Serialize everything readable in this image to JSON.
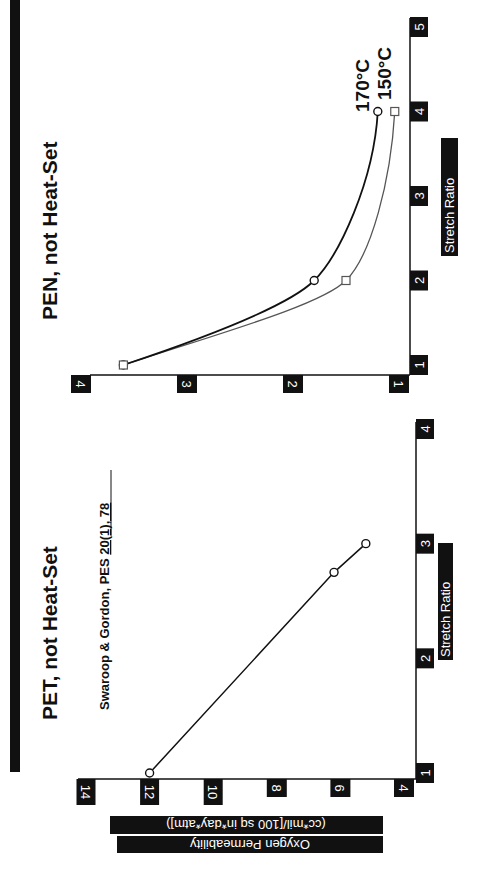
{
  "figure": {
    "orientation": "rotated 90 degrees clockwise",
    "colors": {
      "ink": "#111111",
      "label_box": "#111111",
      "label_text": "#ffffff",
      "series_150": "#555555",
      "background": "#ffffff"
    }
  },
  "y_axis_label": {
    "line1": "Oxygen Permeability",
    "line2": "(cc*mil/[100 sq in*day*atm])"
  },
  "panels": {
    "pet": {
      "title": "PET, not Heat-Set",
      "citation_prefix": "Swaroop & Gordon, PES ",
      "citation_underlined": "20(1), 78",
      "x_label": "Stretch Ratio",
      "x_ticks": [
        "1",
        "2",
        "3",
        "4"
      ],
      "y_ticks": [
        "4",
        "6",
        "8",
        "10",
        "12",
        "14"
      ]
    },
    "pen": {
      "title": "PEN, not Heat-Set",
      "x_label": "Stretch Ratio",
      "x_ticks": [
        "1",
        "2",
        "3",
        "4",
        "5"
      ],
      "y_ticks": [
        "1",
        "2",
        "3",
        "4"
      ],
      "legend": {
        "s170": "170°C",
        "s150": "150°C"
      }
    }
  },
  "chart_data": [
    {
      "type": "line",
      "title": "PET, not Heat-Set",
      "subtitle": "Swaroop & Gordon, PES 20(1), 78",
      "xlabel": "Stretch Ratio",
      "ylabel": "Oxygen Permeability (cc*mil/[100 sq in*day*atm])",
      "xlim": [
        1,
        4
      ],
      "ylim": [
        4,
        14
      ],
      "x_ticks": [
        1,
        2,
        3,
        4
      ],
      "y_ticks": [
        4,
        6,
        8,
        10,
        12,
        14
      ],
      "grid": false,
      "series": [
        {
          "name": "PET",
          "marker": "circle",
          "x": [
            1,
            2.75,
            3
          ],
          "y": [
            12,
            6.2,
            5.2
          ]
        }
      ]
    },
    {
      "type": "line",
      "title": "PEN, not Heat-Set",
      "xlabel": "Stretch Ratio",
      "ylabel": "Oxygen Permeability (cc*mil/[100 sq in*day*atm])",
      "xlim": [
        1,
        5
      ],
      "ylim": [
        1,
        4
      ],
      "x_ticks": [
        1,
        2,
        3,
        4,
        5
      ],
      "y_ticks": [
        1,
        2,
        3,
        4
      ],
      "grid": false,
      "legend_position": "inline at line ends",
      "series": [
        {
          "name": "170°C",
          "marker": "circle",
          "x": [
            1,
            2,
            4
          ],
          "y": [
            3.6,
            1.8,
            1.2
          ]
        },
        {
          "name": "150°C",
          "marker": "square",
          "x": [
            1,
            2,
            4
          ],
          "y": [
            3.6,
            1.5,
            1.04
          ]
        }
      ]
    }
  ]
}
